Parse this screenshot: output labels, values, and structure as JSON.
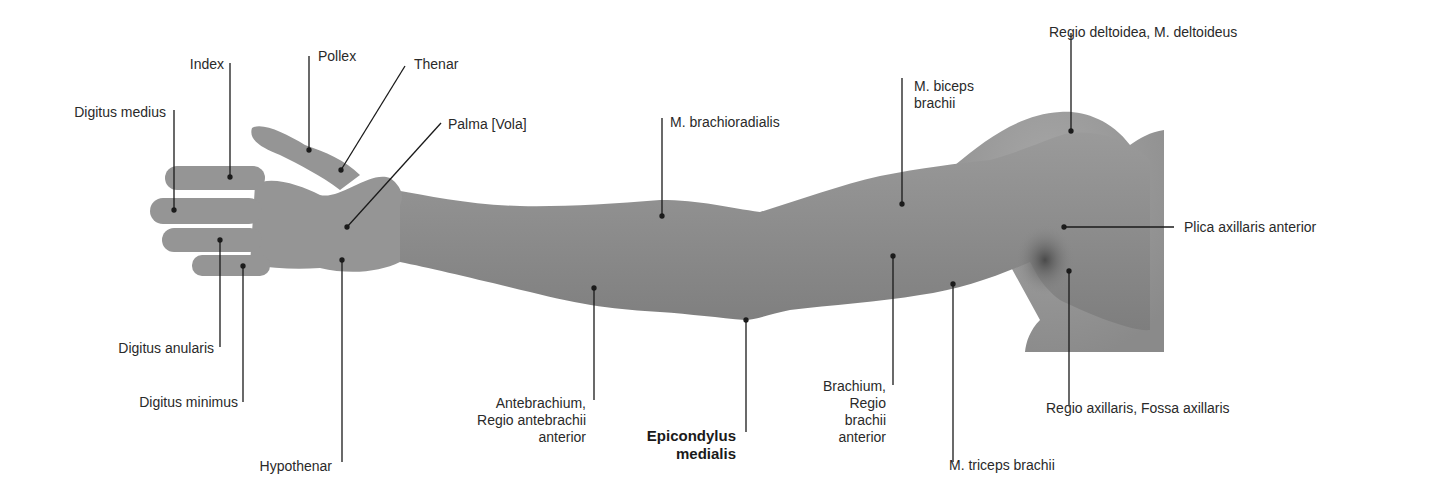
{
  "figure": {
    "background": "#ffffff",
    "skin_color": "#8e8e8e",
    "line_color": "#1a1a1a"
  },
  "labels": {
    "digitus_medius": {
      "text": "Digitus medius",
      "anchor": [
        174,
        210
      ]
    },
    "index": {
      "text": "Index",
      "anchor": [
        230,
        177
      ]
    },
    "pollex": {
      "text": "Pollex",
      "anchor": [
        309,
        150
      ]
    },
    "thenar": {
      "text": "Thenar",
      "anchor": [
        341,
        170
      ]
    },
    "palma": {
      "text": "Palma [Vola]",
      "anchor": [
        347,
        227
      ]
    },
    "digitus_anularis": {
      "text": "Digitus anularis",
      "anchor": [
        220,
        240
      ]
    },
    "digitus_minimus": {
      "text": "Digitus minimus",
      "anchor": [
        243,
        266
      ]
    },
    "hypothenar": {
      "text": "Hypothenar",
      "anchor": [
        342,
        260
      ]
    },
    "m_brachioradialis": {
      "text": "M. brachioradialis",
      "anchor": [
        662,
        216
      ]
    },
    "antebrachium": {
      "lines": [
        "Antebrachium,",
        "Regio antebrachii",
        "anterior"
      ],
      "anchor": [
        594,
        288
      ]
    },
    "epicondylus_medialis": {
      "lines": [
        "Epicondylus",
        "medialis"
      ],
      "anchor": [
        746,
        320
      ],
      "emphasis": "bold"
    },
    "m_biceps_brachii": {
      "lines": [
        "M. biceps",
        "brachii"
      ],
      "anchor": [
        902,
        204
      ]
    },
    "brachium": {
      "lines": [
        "Brachium,",
        "Regio",
        "brachii",
        "anterior"
      ],
      "anchor": [
        893,
        256
      ]
    },
    "m_triceps_brachii": {
      "text": "M. triceps brachii",
      "anchor": [
        953,
        284
      ]
    },
    "regio_deltoidea": {
      "text": "Regio deltoidea, M. deltoideus",
      "anchor": [
        1071,
        131
      ]
    },
    "plica_axillaris_anterior": {
      "text": "Plica axillaris anterior",
      "anchor": [
        1064,
        227
      ]
    },
    "regio_axillaris": {
      "text": "Regio axillaris, Fossa axillaris",
      "anchor": [
        1069,
        271
      ]
    }
  }
}
